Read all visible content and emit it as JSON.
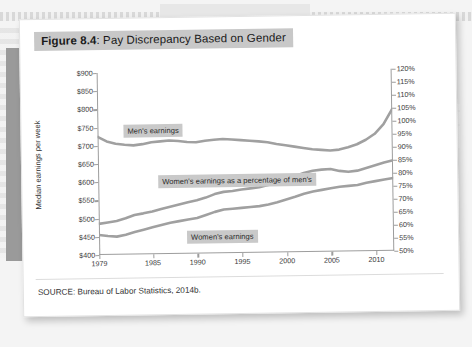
{
  "figure": {
    "number_label": "Figure 8.4",
    "separator": ": ",
    "title": "Pay Discrepancy Based on Gender",
    "source": "SOURCE: Bureau of Labor Statistics, 2014b."
  },
  "colors": {
    "line": "#a0a0a0",
    "axis": "#9d9d9d",
    "title_band": "#c8c8c8",
    "label_band": "#c9c9c9",
    "page": "#ffffff",
    "background": "#f3f3f3"
  },
  "labels": {
    "men": "Men's earnings",
    "percentage": "Women's earnings as a percentage of men's",
    "women": "Women's earnings"
  },
  "chart_data": {
    "type": "line",
    "title": "Pay Discrepancy Based on Gender",
    "xlabel": "",
    "ylabel": "Median earnings per week",
    "y2label": "",
    "grid": false,
    "legend": "inline-annotations",
    "xlim": [
      1979,
      2012
    ],
    "ylim": [
      400,
      900
    ],
    "y2lim": [
      50,
      120
    ],
    "xticks": [
      1979,
      1985,
      1990,
      1995,
      2000,
      2005,
      2010
    ],
    "xtick_labels": [
      "1979",
      "1985",
      "1990",
      "1995",
      "2000",
      "2005",
      "2010"
    ],
    "yticks": [
      400,
      450,
      500,
      550,
      600,
      650,
      700,
      750,
      800,
      850,
      900
    ],
    "ytick_labels": [
      "$400",
      "$450",
      "$500",
      "$550",
      "$600",
      "$650",
      "$700",
      "$750",
      "$800",
      "$850",
      "$900"
    ],
    "y2ticks": [
      50,
      55,
      60,
      65,
      70,
      75,
      80,
      85,
      90,
      95,
      100,
      105,
      110,
      115,
      120
    ],
    "y2tick_labels": [
      "50%",
      "55%",
      "60%",
      "65%",
      "70%",
      "75%",
      "80%",
      "85%",
      "90%",
      "95%",
      "100%",
      "105%",
      "110%",
      "115%",
      "120%"
    ],
    "x": [
      1979,
      1980,
      1981,
      1982,
      1983,
      1984,
      1985,
      1986,
      1987,
      1988,
      1989,
      1990,
      1991,
      1992,
      1993,
      1994,
      1995,
      1996,
      1997,
      1998,
      1999,
      2000,
      2001,
      2002,
      2003,
      2004,
      2005,
      2006,
      2007,
      2008,
      2009,
      2010,
      2011,
      2012
    ],
    "series": [
      {
        "name": "Men's earnings",
        "axis": "left",
        "unit": "dollars per week",
        "values": [
          725,
          712,
          705,
          702,
          700,
          703,
          708,
          710,
          712,
          710,
          707,
          706,
          710,
          712,
          714,
          712,
          710,
          708,
          706,
          703,
          698,
          694,
          690,
          686,
          682,
          680,
          678,
          680,
          686,
          694,
          706,
          722,
          748,
          790
        ]
      },
      {
        "name": "Women's earnings",
        "axis": "left",
        "unit": "dollars per week",
        "values": [
          455,
          452,
          450,
          455,
          462,
          468,
          474,
          480,
          486,
          490,
          494,
          498,
          506,
          514,
          520,
          522,
          524,
          526,
          528,
          532,
          538,
          545,
          552,
          560,
          566,
          570,
          574,
          578,
          580,
          582,
          588,
          592,
          596,
          600
        ]
      },
      {
        "name": "Women's earnings as a percentage of men's",
        "axis": "right",
        "unit": "percent",
        "values": [
          62.0,
          62.5,
          63.0,
          64.0,
          65.2,
          65.8,
          66.5,
          67.4,
          68.2,
          69.0,
          69.8,
          70.5,
          71.5,
          72.8,
          73.6,
          73.9,
          74.4,
          74.8,
          75.2,
          76.0,
          77.0,
          78.0,
          79.2,
          80.4,
          81.2,
          81.6,
          81.8,
          81.0,
          80.6,
          81.0,
          82.0,
          83.0,
          84.0,
          84.8
        ]
      }
    ],
    "annotations": [
      {
        "text": "Men's earnings",
        "x": 1983,
        "y": 745
      },
      {
        "text": "Women's earnings as a percentage of men's",
        "x": 1987,
        "y": 625
      },
      {
        "text": "Women's earnings",
        "x": 1995,
        "y": 470
      }
    ]
  }
}
